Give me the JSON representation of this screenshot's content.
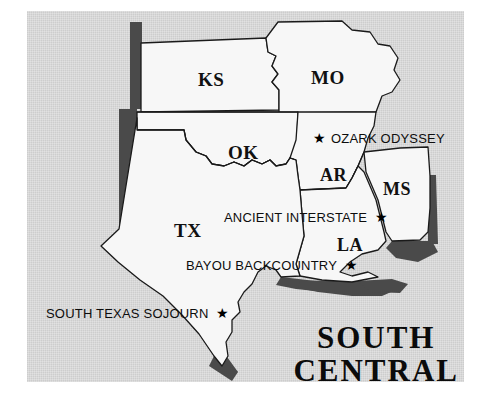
{
  "region": {
    "title_line1": "SOUTH",
    "title_line2": "CENTRAL"
  },
  "colors": {
    "panel_background": "#d8d8d8",
    "page_background": "#ffffff",
    "state_fill": "#f7f7f7",
    "state_outline": "#1a1a1a",
    "drop_shadow": "#4a4a4a",
    "label_text": "#111111",
    "star_marker": "#000000"
  },
  "states": [
    {
      "code": "KS",
      "name": "Kansas",
      "label_x": 198,
      "label_y": 70,
      "font_size": 19
    },
    {
      "code": "MO",
      "name": "Missouri",
      "label_x": 311,
      "label_y": 68,
      "font_size": 19
    },
    {
      "code": "OK",
      "name": "Oklahoma",
      "label_x": 228,
      "label_y": 143,
      "font_size": 19
    },
    {
      "code": "AR",
      "name": "Arkansas",
      "label_x": 320,
      "label_y": 166,
      "font_size": 18
    },
    {
      "code": "MS",
      "name": "Mississippi",
      "label_x": 383,
      "label_y": 180,
      "font_size": 18
    },
    {
      "code": "TX",
      "name": "Texas",
      "label_x": 174,
      "label_y": 221,
      "font_size": 19
    },
    {
      "code": "LA",
      "name": "Louisiana",
      "label_x": 337,
      "label_y": 236,
      "font_size": 18
    }
  ],
  "points_of_interest": [
    {
      "label": "OZARK ODYSSEY",
      "marker": "star",
      "marker_side": "left",
      "x": 313,
      "y": 131
    },
    {
      "label": "ANCIENT INTERSTATE",
      "marker": "star",
      "marker_side": "right",
      "x": 224,
      "y": 210
    },
    {
      "label": "BAYOU BACKCOUNTRY",
      "marker": "star",
      "marker_side": "right",
      "x": 186,
      "y": 258
    },
    {
      "label": "SOUTH TEXAS SOJOURN",
      "marker": "star",
      "marker_side": "right",
      "x": 46,
      "y": 306
    }
  ],
  "star_glyph": "★"
}
